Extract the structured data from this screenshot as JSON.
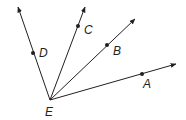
{
  "diagram": {
    "type": "rays-from-common-vertex",
    "vertex": {
      "label": "E",
      "x": 50,
      "y": 100,
      "label_x": 45,
      "label_y": 116
    },
    "rays": [
      {
        "name": "EA",
        "end": [
          176,
          64
        ],
        "point": {
          "label": "A",
          "x": 142,
          "y": 74,
          "label_x": 143,
          "label_y": 88
        }
      },
      {
        "name": "EB",
        "end": [
          135,
          19
        ],
        "point": {
          "label": "B",
          "x": 107,
          "y": 45,
          "label_x": 113,
          "label_y": 55
        }
      },
      {
        "name": "EC",
        "end": [
          85,
          7
        ],
        "point": {
          "label": "C",
          "x": 78,
          "y": 26,
          "label_x": 84,
          "label_y": 34
        }
      },
      {
        "name": "ED",
        "end": [
          18,
          7
        ],
        "point": {
          "label": "D",
          "x": 33,
          "y": 53,
          "label_x": 39,
          "label_y": 57
        }
      }
    ],
    "colors": {
      "stroke": "#231f20",
      "background": "#ffffff"
    }
  }
}
